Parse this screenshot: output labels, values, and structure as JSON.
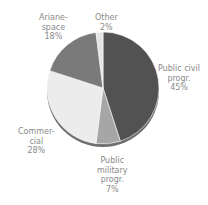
{
  "chart_data": {
    "type": "pie",
    "title": "",
    "categories": [
      "Public civil progr.",
      "Public military progr.",
      "Commercial",
      "Arianespace",
      "Other"
    ],
    "values": [
      45,
      7,
      28,
      18,
      2
    ],
    "unit": "%",
    "start_angle_deg": 0,
    "direction": "clockwise",
    "colors": [
      "#525252",
      "#a6a6a6",
      "#ececec",
      "#7a7a7a",
      "#e4e4e4"
    ],
    "legend": "none (direct labels)",
    "labels": [
      {
        "lines": [
          "Public civil",
          "progr."
        ],
        "pct": "45%"
      },
      {
        "lines": [
          "Public",
          "military",
          "progr."
        ],
        "pct": "7%"
      },
      {
        "lines": [
          "Commer-",
          "cial"
        ],
        "pct": "28%"
      },
      {
        "lines": [
          "Ariane-",
          "space"
        ],
        "pct": "18%"
      },
      {
        "lines": [
          "Other"
        ],
        "pct": "2%"
      }
    ]
  }
}
